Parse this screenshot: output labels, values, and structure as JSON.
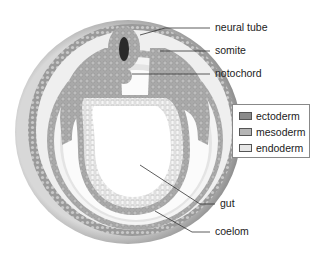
{
  "labels": {
    "neural_tube": "neural tube",
    "somite": "somite",
    "notochord": "notochord",
    "gut": "gut",
    "coelom": "coelom"
  },
  "legend": {
    "items": [
      {
        "label": "ectoderm",
        "color": "#8a8a8a"
      },
      {
        "label": "mesoderm",
        "color": "#b5b5b5"
      },
      {
        "label": "endoderm",
        "color": "#e6e6e6"
      }
    ]
  }
}
